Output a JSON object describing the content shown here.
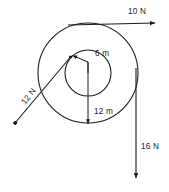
{
  "diagram": {
    "type": "force-diagram",
    "colors": {
      "stroke": "#1a1a1a",
      "background": "#ffffff",
      "text": "#1a1a1a"
    },
    "geometry": {
      "center": {
        "x": 88,
        "y": 73
      },
      "inner_circle_radius": 23,
      "outer_circle_radius": 50
    },
    "radii": [
      {
        "name": "inner-radius",
        "label": "6 m",
        "value": 6,
        "unit": "m",
        "label_x": 95,
        "label_y": 53
      },
      {
        "name": "outer-radius",
        "label": "12 m",
        "value": 12,
        "unit": "m",
        "label_x": 94,
        "label_y": 111
      }
    ],
    "forces": [
      {
        "name": "force-top",
        "label": "10 N",
        "value": 10,
        "unit": "N",
        "direction": "right",
        "label_x": 128,
        "label_y": 14,
        "rotation": 0
      },
      {
        "name": "force-left",
        "label": "12 N",
        "value": 12,
        "unit": "N",
        "direction": "down-left",
        "label_x": 25,
        "label_y": 105,
        "rotation": -52
      },
      {
        "name": "force-right",
        "label": "16 N",
        "value": 16,
        "unit": "N",
        "direction": "down",
        "label_x": 141,
        "label_y": 149,
        "rotation": 0
      }
    ]
  }
}
